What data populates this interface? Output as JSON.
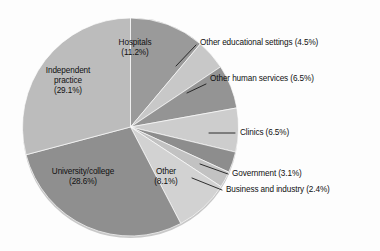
{
  "figure": {
    "background_color": "#fdfdfd",
    "text_color": "#101010",
    "rim_color": "#cfcfcf"
  },
  "chart_data": {
    "type": "pie",
    "title": "",
    "subtitle": "",
    "xlabel": "",
    "ylabel": "",
    "legend_position": "none",
    "grid": false,
    "start_angle_deg": 0,
    "direction": "clockwise",
    "units": "percent",
    "categories": [
      "Hospitals",
      "Other educational settings",
      "Other human services",
      "Clinics",
      "Government",
      "Business and industry",
      "Other",
      "University/college",
      "Independent practice"
    ],
    "values": [
      11.2,
      4.5,
      6.5,
      6.5,
      3.1,
      2.4,
      8.1,
      28.6,
      29.1
    ],
    "colors": [
      "#9a9a9a",
      "#c8c8c8",
      "#949494",
      "#cdcdcd",
      "#8d8d8d",
      "#c2c2c2",
      "#d2d2d2",
      "#8f8f8f",
      "#bcbcbc"
    ],
    "slices": [
      {
        "name": "Hospitals",
        "value": 11.2,
        "value_text": "(11.2%)",
        "color": "#9a9a9a",
        "label_placement": "inside"
      },
      {
        "name": "Other educational settings",
        "value": 4.5,
        "value_text": "(4.5%)",
        "color": "#c8c8c8",
        "label_placement": "callout"
      },
      {
        "name": "Other human services",
        "value": 6.5,
        "value_text": "(6.5%)",
        "color": "#949494",
        "label_placement": "callout"
      },
      {
        "name": "Clinics",
        "value": 6.5,
        "value_text": "(6.5%)",
        "color": "#cdcdcd",
        "label_placement": "callout"
      },
      {
        "name": "Government",
        "value": 3.1,
        "value_text": "(3.1%)",
        "color": "#8d8d8d",
        "label_placement": "callout"
      },
      {
        "name": "Business and industry",
        "value": 2.4,
        "value_text": "(2.4%)",
        "color": "#c2c2c2",
        "label_placement": "callout"
      },
      {
        "name": "Other",
        "value": 8.1,
        "value_text": "(8.1%)",
        "color": "#d2d2d2",
        "label_placement": "inside"
      },
      {
        "name": "University/college",
        "value": 28.6,
        "value_text": "(28.6%)",
        "color": "#8f8f8f",
        "label_placement": "inside"
      },
      {
        "name": "Independent practice",
        "value": 29.1,
        "value_text": "(29.1%)",
        "color": "#bcbcbc",
        "label_placement": "inside"
      }
    ]
  },
  "labels": {
    "hospitals": {
      "line1": "Hospitals",
      "line2": "(11.2%)"
    },
    "independent_practice": {
      "line1": "Independent",
      "line2": "practice",
      "line3": "(29.1%)"
    },
    "university_college": {
      "line1": "University/college",
      "line2": "(28.6%)"
    },
    "other_inside": {
      "line1": "Other",
      "line2": "(8.1%)"
    },
    "other_educational_settings": {
      "text": "Other educational settings (4.5%)"
    },
    "other_human_services": {
      "text": "Other human services (6.5%)"
    },
    "clinics": {
      "text": "Clinics (6.5%)"
    },
    "government": {
      "text": "Government (3.1%)"
    },
    "business_and_industry": {
      "text": "Business and industry (2.4%)"
    }
  }
}
